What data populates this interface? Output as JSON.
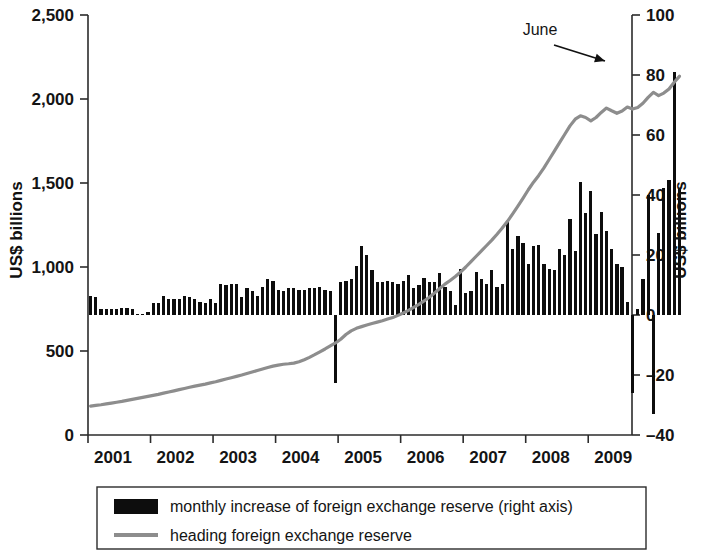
{
  "chart_data": {
    "type": "bar",
    "title": "",
    "subtitle": "",
    "xlabel": "",
    "ylabel": "US$ billions",
    "ylabel_right": "US$ billions",
    "grid": false,
    "legend_position": "bottom",
    "x_ticks": [
      "2001",
      "2002",
      "2003",
      "2004",
      "2005",
      "2006",
      "2007",
      "2008",
      "2009"
    ],
    "x_range": [
      2001,
      2009.7
    ],
    "left_axis": {
      "label": "US$ billions",
      "ticks": [
        "0",
        "500",
        "1,000",
        "1,500",
        "2,000",
        "2,500"
      ],
      "tick_values": [
        0,
        500,
        1000,
        1500,
        2000,
        2500
      ],
      "ylim": [
        0,
        2500
      ]
    },
    "right_axis": {
      "label": "US$ billions",
      "ticks": [
        "–40",
        "–20",
        "0",
        "20",
        "40",
        "60",
        "80",
        "100"
      ],
      "tick_values": [
        -40,
        -20,
        0,
        20,
        40,
        60,
        80,
        100
      ],
      "ylim": [
        -40,
        100
      ]
    },
    "annotations": [
      {
        "text": "June",
        "points_to_x": 2009.45,
        "points_to_y_right": 80
      }
    ],
    "series": [
      {
        "name": "monthly increase of foreign exchange reserve (right axis)",
        "type": "bar",
        "axis": "right",
        "color": "#0d0d0d",
        "x_start": 2001.0,
        "x_step": 0.0833333,
        "values": [
          6.5,
          6.0,
          2.0,
          2.0,
          2.0,
          2.0,
          2.5,
          2.5,
          2.0,
          0.5,
          0.5,
          1.0,
          4.0,
          4.0,
          6.5,
          5.5,
          5.5,
          5.5,
          6.5,
          6.0,
          5.5,
          4.5,
          4.0,
          5.5,
          4.0,
          10.5,
          10.0,
          10.5,
          10.5,
          6.0,
          9.0,
          8.0,
          6.5,
          9.5,
          12.0,
          11.5,
          8.5,
          8.0,
          9.0,
          9.0,
          8.5,
          8.5,
          9.0,
          9.0,
          9.5,
          8.5,
          8.0,
          -22.5,
          11.0,
          11.5,
          12.0,
          16.5,
          23.0,
          20.0,
          15.0,
          11.0,
          11.0,
          11.5,
          11.0,
          10.5,
          11.5,
          13.5,
          9.0,
          10.0,
          12.5,
          11.0,
          11.0,
          14.0,
          9.5,
          8.0,
          3.5,
          15.5,
          7.5,
          8.0,
          14.5,
          12.0,
          10.5,
          15.0,
          9.5,
          10.5,
          31.0,
          22.0,
          26.5,
          24.0,
          17.0,
          23.0,
          23.5,
          17.0,
          15.5,
          15.0,
          22.0,
          20.0,
          32.0,
          21.5,
          44.5,
          34.0,
          41.5,
          27.0,
          34.5,
          28.0,
          22.0,
          17.0,
          16.0,
          4.5,
          -26.0,
          2.0,
          12.0,
          40.0,
          -33.0,
          27.5,
          42.5,
          45.0,
          81.0,
          42.0
        ]
      },
      {
        "name": "heading foreign exchange reserve",
        "type": "line",
        "axis": "left",
        "color": "#8d8d8d",
        "x_start": 2001.0,
        "x_step": 0.0833333,
        "values": [
          172,
          176,
          180,
          185,
          190,
          195,
          200,
          206,
          212,
          218,
          224,
          230,
          236,
          242,
          249,
          256,
          263,
          270,
          277,
          284,
          291,
          297,
          303,
          310,
          317,
          325,
          333,
          341,
          349,
          357,
          366,
          375,
          384,
          393,
          402,
          410,
          416,
          421,
          424,
          428,
          436,
          448,
          462,
          478,
          495,
          512,
          530,
          548,
          570,
          598,
          620,
          635,
          645,
          655,
          664,
          672,
          680,
          690,
          700,
          712,
          726,
          742,
          760,
          778,
          798,
          820,
          845,
          872,
          898,
          920,
          944,
          970,
          1000,
          1032,
          1064,
          1096,
          1128,
          1160,
          1195,
          1232,
          1272,
          1316,
          1362,
          1410,
          1460,
          1505,
          1545,
          1590,
          1640,
          1690,
          1740,
          1790,
          1840,
          1880,
          1900,
          1890,
          1870,
          1890,
          1920,
          1946,
          1930,
          1915,
          1928,
          1952,
          1940,
          1950,
          1975,
          2010,
          2040,
          2020,
          2035,
          2060,
          2100,
          2135
        ]
      }
    ],
    "legend": [
      {
        "marker": "bar-swatch",
        "color": "#0d0d0d",
        "label": "monthly increase of foreign exchange reserve (right axis)"
      },
      {
        "marker": "line-swatch",
        "color": "#8d8d8d",
        "label": "heading foreign exchange reserve"
      }
    ]
  }
}
